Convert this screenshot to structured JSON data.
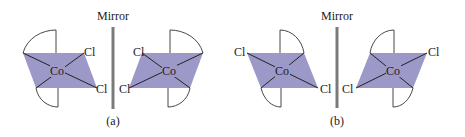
{
  "figure": {
    "colors": {
      "plane": "#9c98c8",
      "mirror": "#7a7a7a",
      "lines": "#222222"
    },
    "panels": [
      {
        "caption": "(a)",
        "mirror_label": "Mirror",
        "molecules": [
          {
            "center_label": "Co",
            "ligand_labels": [
              "Cl",
              "Cl"
            ]
          },
          {
            "center_label": "Co",
            "ligand_labels": [
              "Cl",
              "Cl"
            ]
          }
        ]
      },
      {
        "caption": "(b)",
        "mirror_label": "Mirror",
        "molecules": [
          {
            "center_label": "Co",
            "ligand_labels": [
              "Cl",
              "Cl"
            ]
          },
          {
            "center_label": "Co",
            "ligand_labels": [
              "Cl",
              "Cl"
            ]
          }
        ]
      }
    ]
  }
}
